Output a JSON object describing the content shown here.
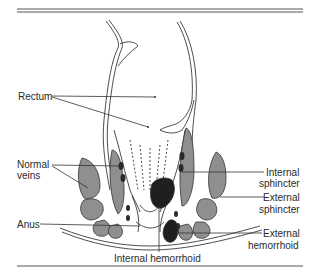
{
  "figure": {
    "colors": {
      "line": "#3a3a3a",
      "muscle_fill": "#8f8f8f",
      "hemorrhoid_fill": "#1f1f1f",
      "background": "#ffffff"
    }
  },
  "labels": {
    "rectum": "Rectum",
    "normal_veins_line1": "Normal",
    "normal_veins_line2": "veins",
    "anus": "Anus",
    "internal_sphincter_line1": "Internal",
    "internal_sphincter_line2": "sphincter",
    "external_sphincter_line1": "External",
    "external_sphincter_line2": "sphincter",
    "external_hemorrhoid_line1": "External",
    "external_hemorrhoid_line2": "hemorrhoid",
    "internal_hemorrhoid": "Internal hemorrhoid"
  }
}
